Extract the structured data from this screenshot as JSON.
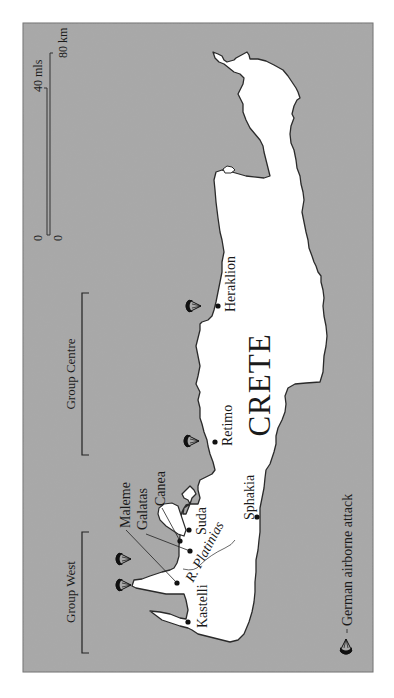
{
  "map": {
    "title": "CRETE",
    "orientation": "rotated 90° counter-clockwise (north to the left)",
    "colors": {
      "sea": "#a8a8a8",
      "land": "#ffffff",
      "coast": "#2a2a2a",
      "ink": "#1a1a1a",
      "frame": "#6e6e6e"
    },
    "scale_bar": {
      "zero_top": "0",
      "zero_bottom": "0",
      "miles_label": "40 mls",
      "km_label": "80 km"
    },
    "groups": [
      {
        "name": "Group Centre"
      },
      {
        "name": "Group West"
      }
    ],
    "places": [
      {
        "name": "Heraklion"
      },
      {
        "name": "Retimo"
      },
      {
        "name": "Canea"
      },
      {
        "name": "Galatas"
      },
      {
        "name": "Maleme"
      },
      {
        "name": "Suda"
      },
      {
        "name": "Sphakia"
      },
      {
        "name": "Kastelli"
      }
    ],
    "river": {
      "name": "R. Platinias"
    },
    "legend": {
      "items": [
        {
          "icon": "parachute-icon",
          "label": "German airborne attack"
        }
      ]
    },
    "airborne_attacks": [
      {
        "location": "Heraklion"
      },
      {
        "location": "Retimo"
      },
      {
        "location": "Maleme/Galatas"
      },
      {
        "location": "Maleme/Galatas"
      }
    ]
  }
}
